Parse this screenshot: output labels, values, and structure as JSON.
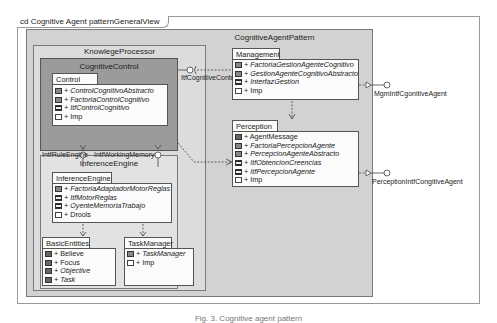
{
  "frame": {
    "title": "cd Cognitive Agent patternGeneralView"
  },
  "packages": {
    "cognitive_agent_pattern": "CognitiveAgentPattern",
    "knowlege_processor": "KnowlegeProcessor",
    "cognitive_control": "CognitiveControl",
    "inference_engine": "InferenceEngine"
  },
  "classes": {
    "control": {
      "name": "Control",
      "items": [
        {
          "label": "+ ControlCognitivoAbstracto",
          "icon": "abstract-class-icon",
          "italic": true
        },
        {
          "label": "+ FactoriaControlCognitivo",
          "icon": "abstract-class-icon",
          "italic": true
        },
        {
          "label": "+ ItfControlCognitivo",
          "icon": "interface-icon",
          "italic": true
        },
        {
          "label": "+ Imp",
          "icon": "package-icon",
          "italic": false
        }
      ]
    },
    "inference_engine": {
      "name": "InferenceEngine",
      "items": [
        {
          "label": "+ FactoriaAdaptadorMotorReglas",
          "icon": "abstract-class-icon",
          "italic": true
        },
        {
          "label": "+ ItfMotorReglas",
          "icon": "interface-icon",
          "italic": true
        },
        {
          "label": "+ OyenteMemoriaTrabajo",
          "icon": "interface-icon",
          "italic": true
        },
        {
          "label": "+ Drools",
          "icon": "package-icon",
          "italic": false
        }
      ]
    },
    "basic_entities": {
      "name": "BasicEntities",
      "items": [
        {
          "label": "+ Believe",
          "icon": "class-icon",
          "italic": false
        },
        {
          "label": "+ Focus",
          "icon": "class-icon",
          "italic": false
        },
        {
          "label": "+ Objective",
          "icon": "class-icon",
          "italic": true
        },
        {
          "label": "+ Task",
          "icon": "class-icon",
          "italic": true
        }
      ]
    },
    "task_manager": {
      "name": "TaskManager",
      "items": [
        {
          "label": "+ TaskManager",
          "icon": "abstract-class-icon",
          "italic": true
        },
        {
          "label": "+ Imp",
          "icon": "package-icon",
          "italic": false
        }
      ]
    },
    "management": {
      "name": "Management",
      "items": [
        {
          "label": "+ FactoriaGestionAgenteCognitivo",
          "icon": "abstract-class-icon",
          "italic": true
        },
        {
          "label": "+ GestionAgenteCognitivoAbstracto",
          "icon": "abstract-class-icon",
          "italic": true
        },
        {
          "label": "+ InterfazGestion",
          "icon": "interface-icon",
          "italic": true
        },
        {
          "label": "+ Imp",
          "icon": "package-icon",
          "italic": false
        }
      ]
    },
    "perception": {
      "name": "Perception",
      "items": [
        {
          "label": "+ AgentMessage",
          "icon": "class-icon",
          "italic": false
        },
        {
          "label": "+ FactoriaPercepcionAgente",
          "icon": "abstract-class-icon",
          "italic": true
        },
        {
          "label": "+ PercepcionAgenteAbstracto",
          "icon": "abstract-class-icon",
          "italic": true
        },
        {
          "label": "+ ItfObtencionCreencias",
          "icon": "interface-icon",
          "italic": true
        },
        {
          "label": "+ ItfPercepcionAgente",
          "icon": "interface-icon",
          "italic": true
        },
        {
          "label": "+ Imp",
          "icon": "package-icon",
          "italic": false
        }
      ]
    }
  },
  "interfaces": {
    "itf_cognitive_control": "ItfCognitiveContr",
    "itf_rule_engine": "IntfRuleEngine",
    "itf_working_memory": "IntfWorkingMemory",
    "mgm_itf": "MgmIntfCgonitiveAgent",
    "perception_itf": "PerceptionIntfCongitiveAgent"
  },
  "caption": "Fig. 3. Cognitive agent pattern"
}
